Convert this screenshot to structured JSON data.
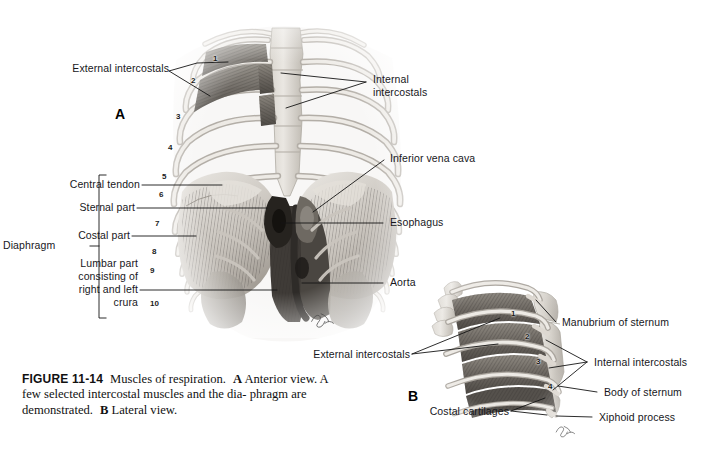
{
  "figure": {
    "number": "FIGURE 11-14",
    "title": "Muscles of respiration.",
    "part_a_marker": "A",
    "part_a_text": "Anterior view. A few selected intercostal muscles and the dia-phragm are demonstrated.",
    "part_b_marker": "B",
    "part_b_text": "Lateral view.",
    "caption_line1_a": "Anterior",
    "caption_line2": "view. A few selected intercostal muscles and the dia-",
    "caption_line3": "phragm are demonstrated.",
    "caption_line3_b": "Lateral view."
  },
  "panels": {
    "a": {
      "letter": "A",
      "view": "Anterior view"
    },
    "b": {
      "letter": "B",
      "view": "Lateral view"
    }
  },
  "panel_a_labels": {
    "external_intercostals": "External intercostals",
    "internal_intercostals_l1": "Internal",
    "internal_intercostals_l2": "intercostals",
    "inferior_vena_cava": "Inferior vena cava",
    "esophagus": "Esophagus",
    "aorta": "Aorta",
    "diaphragm": "Diaphragm",
    "central_tendon": "Central tendon",
    "sternal_part": "Sternal part",
    "costal_part": "Costal part",
    "lumbar_part_l1": "Lumbar part",
    "lumbar_part_l2": "consisting of",
    "lumbar_part_l3": "right and left",
    "lumbar_part_l4": "crura"
  },
  "panel_b_labels": {
    "external_intercostals": "External intercostals",
    "costal_cartilages": "Costal cartilages",
    "manubrium_of_sternum": "Manubrium of sternum",
    "internal_intercostals": "Internal intercostals",
    "body_of_sternum": "Body of sternum",
    "xiphoid_process": "Xiphoid process"
  },
  "rib_numbers_panel_a": [
    "1",
    "2",
    "3",
    "4",
    "5",
    "6",
    "7",
    "8",
    "9",
    "10"
  ],
  "rib_numbers_panel_b": [
    "1",
    "2",
    "3",
    "4"
  ],
  "colors": {
    "background": "#ffffff",
    "text": "#17171c",
    "leader_line": "#151515",
    "bone_light": "#ece9e4",
    "bone_mid": "#cfcac3",
    "bone_shadow": "#a7a29b",
    "muscle_dark": "#4e4a46",
    "muscle_mid": "#6f6a65",
    "organ_mid": "#8e8982"
  },
  "artist_signature": "artist-signature"
}
